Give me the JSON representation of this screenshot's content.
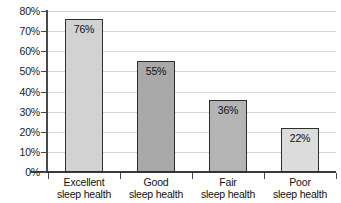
{
  "chart_data": {
    "type": "bar",
    "title": "",
    "subtitle": "",
    "xlabel": "",
    "ylabel": "",
    "categories": [
      "Excellent sleep health",
      "Good sleep health",
      "Fair sleep health",
      "Poor sleep health"
    ],
    "category_lines": [
      [
        "Excellent",
        "sleep health"
      ],
      [
        "Good",
        "sleep health"
      ],
      [
        "Fair",
        "sleep health"
      ],
      [
        "Poor",
        "sleep health"
      ]
    ],
    "values": [
      76,
      55,
      36,
      22
    ],
    "value_labels": [
      "76%",
      "55%",
      "36%",
      "22%"
    ],
    "bar_colors": [
      "#d2d2d2",
      "#a9a9a9",
      "#b4b4b4",
      "#dcdcdc"
    ],
    "bar_border_color": "#2e2e2e",
    "ylim": [
      0,
      80
    ],
    "ytick_values": [
      0,
      10,
      20,
      30,
      40,
      50,
      60,
      70,
      80
    ],
    "ytick_labels": [
      "0%",
      "10%",
      "20%",
      "30%",
      "40%",
      "50%",
      "60%",
      "70%",
      "80%"
    ],
    "grid": true,
    "gridline_color": "#d8d8d8",
    "axis_color": "#3a3a3a",
    "legend": false,
    "legend_position": "none",
    "background_color": "#ffffff"
  }
}
